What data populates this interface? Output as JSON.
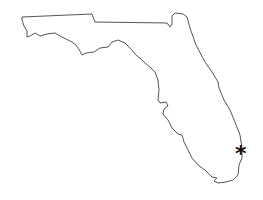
{
  "map": {
    "region": "Florida",
    "outline_color": "#555555",
    "background": "#ffffff",
    "marker": {
      "glyph": "*",
      "x": 241,
      "y": 155,
      "color": "#111111",
      "location_hint": "southeast coast"
    }
  }
}
